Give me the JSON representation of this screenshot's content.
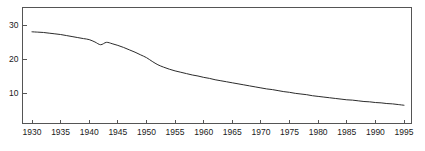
{
  "chart_data": {
    "type": "line",
    "title": "",
    "subtitle": "",
    "xlabel": "",
    "ylabel": "",
    "xlim": [
      1930,
      1995
    ],
    "ylim": [
      0,
      35
    ],
    "grid": false,
    "legend": false,
    "legend_position": "none",
    "x_ticks": [
      1930,
      1935,
      1940,
      1945,
      1950,
      1955,
      1960,
      1965,
      1970,
      1975,
      1980,
      1985,
      1990,
      1995
    ],
    "x_tick_labels": [
      "1930",
      "1935",
      "1940",
      "1945",
      "1950",
      "1955",
      "1960",
      "1965",
      "1970",
      "1975",
      "1980",
      "1985",
      "1990",
      "1995"
    ],
    "y_ticks": [
      10,
      20,
      30
    ],
    "y_tick_labels": [
      "10",
      "20",
      "30"
    ],
    "line_color": "#2b2b2b",
    "axis_color": "#555555",
    "series": [
      {
        "name": "rate",
        "x": [
          1930,
          1931,
          1932,
          1933,
          1934,
          1935,
          1936,
          1937,
          1938,
          1939,
          1940,
          1941,
          1942,
          1943,
          1944,
          1945,
          1946,
          1947,
          1948,
          1949,
          1950,
          1951,
          1952,
          1953,
          1954,
          1955,
          1956,
          1957,
          1958,
          1959,
          1960,
          1961,
          1962,
          1963,
          1964,
          1965,
          1966,
          1967,
          1968,
          1969,
          1970,
          1971,
          1972,
          1973,
          1974,
          1975,
          1976,
          1977,
          1978,
          1979,
          1980,
          1981,
          1982,
          1983,
          1984,
          1985,
          1986,
          1987,
          1988,
          1989,
          1990,
          1991,
          1992,
          1993,
          1994,
          1995
        ],
        "values": [
          28.0,
          27.9,
          27.8,
          27.6,
          27.4,
          27.2,
          26.9,
          26.6,
          26.3,
          26.0,
          25.7,
          25.0,
          24.2,
          24.9,
          24.5,
          24.0,
          23.4,
          22.7,
          22.0,
          21.2,
          20.4,
          19.3,
          18.3,
          17.6,
          17.0,
          16.5,
          16.1,
          15.7,
          15.3,
          15.0,
          14.6,
          14.3,
          13.9,
          13.6,
          13.3,
          13.0,
          12.7,
          12.4,
          12.1,
          11.8,
          11.5,
          11.2,
          11.0,
          10.7,
          10.4,
          10.2,
          9.9,
          9.7,
          9.5,
          9.2,
          9.0,
          8.8,
          8.6,
          8.4,
          8.2,
          8.0,
          7.9,
          7.7,
          7.5,
          7.4,
          7.2,
          7.1,
          6.9,
          6.8,
          6.6,
          6.4
        ]
      }
    ]
  },
  "caption": {
    "text": ""
  }
}
